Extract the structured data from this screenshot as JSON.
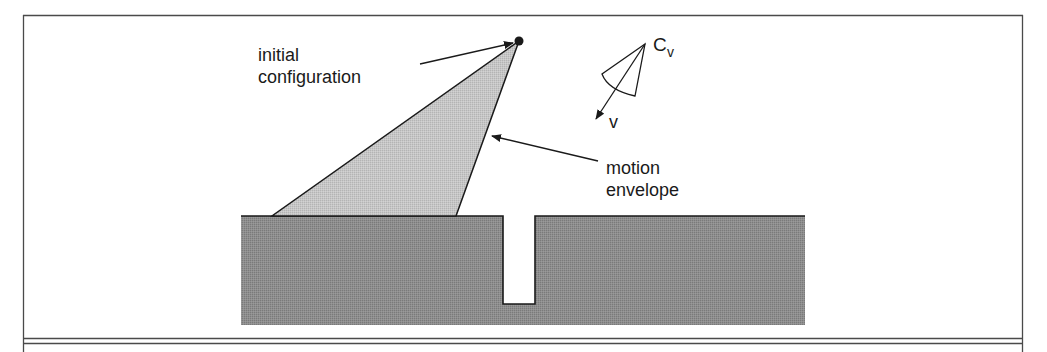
{
  "figure": {
    "labels": {
      "initial_config_line1": "initial",
      "initial_config_line2": "configuration",
      "motion_envelope_line1": "motion",
      "motion_envelope_line2": "envelope",
      "cone_label_main": "C",
      "cone_label_sub": "v",
      "velocity_label": "v"
    },
    "colors": {
      "frame": "#4a4a4a",
      "ground_fill": "#8c8c8c",
      "envelope_fill": "#c4c4c4",
      "stroke": "#1a1a1a",
      "background": "#ffffff"
    }
  }
}
